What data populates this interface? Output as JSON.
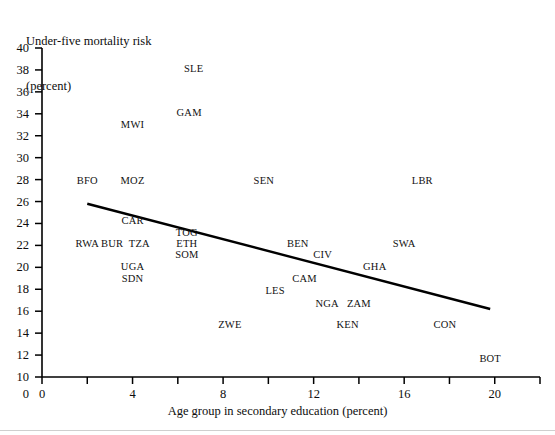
{
  "chart_data": {
    "type": "scatter",
    "title": "",
    "ylabel": "Under-five mortality risk\n(percent)",
    "ylabel_line1": "Under-five mortality risk",
    "ylabel_line2": "(percent)",
    "xlabel": "Age group in secondary education (percent)",
    "xlim": [
      0,
      22
    ],
    "ylim": [
      10,
      40
    ],
    "xticks": [
      0,
      4,
      8,
      12,
      16,
      20
    ],
    "xticks_minor": [
      2,
      6,
      10,
      14,
      18,
      22
    ],
    "yticks": [
      10,
      12,
      14,
      16,
      18,
      20,
      22,
      24,
      26,
      28,
      30,
      32,
      34,
      36,
      38,
      40
    ],
    "grid": false,
    "legend": "none",
    "marker": "text-label",
    "points": [
      {
        "label": "SLE",
        "x": 6.7,
        "y": 38.1
      },
      {
        "label": "GAM",
        "x": 6.5,
        "y": 34.1
      },
      {
        "label": "MWI",
        "x": 4.0,
        "y": 33.0
      },
      {
        "label": "BFO",
        "x": 2.0,
        "y": 27.9
      },
      {
        "label": "MOZ",
        "x": 4.0,
        "y": 27.9
      },
      {
        "label": "SEN",
        "x": 9.8,
        "y": 27.9
      },
      {
        "label": "LBR",
        "x": 16.8,
        "y": 27.9
      },
      {
        "label": "CAR",
        "x": 4.0,
        "y": 24.2
      },
      {
        "label": "TOG",
        "x": 6.4,
        "y": 23.1
      },
      {
        "label": "RWA",
        "x": 2.0,
        "y": 22.1
      },
      {
        "label": "BUR",
        "x": 3.1,
        "y": 22.1
      },
      {
        "label": "TZA",
        "x": 4.3,
        "y": 22.1
      },
      {
        "label": "ETH",
        "x": 6.4,
        "y": 22.1
      },
      {
        "label": "BEN",
        "x": 11.3,
        "y": 22.1
      },
      {
        "label": "SWA",
        "x": 16.0,
        "y": 22.1
      },
      {
        "label": "SOM",
        "x": 6.4,
        "y": 21.1
      },
      {
        "label": "CIV",
        "x": 12.4,
        "y": 21.1
      },
      {
        "label": "UGA",
        "x": 4.0,
        "y": 20.0
      },
      {
        "label": "GHA",
        "x": 14.7,
        "y": 20.0
      },
      {
        "label": "SDN",
        "x": 4.0,
        "y": 18.9
      },
      {
        "label": "CAM",
        "x": 11.6,
        "y": 18.9
      },
      {
        "label": "LES",
        "x": 10.3,
        "y": 17.8
      },
      {
        "label": "NGA",
        "x": 12.6,
        "y": 16.7
      },
      {
        "label": "ZAM",
        "x": 14.0,
        "y": 16.7
      },
      {
        "label": "ZWE",
        "x": 8.3,
        "y": 14.7
      },
      {
        "label": "KEN",
        "x": 13.5,
        "y": 14.7
      },
      {
        "label": "CON",
        "x": 17.8,
        "y": 14.7
      },
      {
        "label": "BOT",
        "x": 19.8,
        "y": 11.6
      }
    ],
    "trendline": {
      "x_start": 2.0,
      "y_start": 25.8,
      "x_end": 19.8,
      "y_end": 16.2,
      "description": "downward-sloping fitted regression line"
    }
  }
}
